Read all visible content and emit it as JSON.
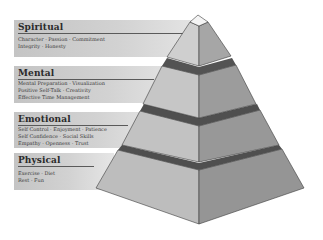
{
  "diagram": {
    "type": "pyramid",
    "tiers": [
      {
        "name": "Spiritual",
        "items": [
          "Character · Passion · Commitment",
          "Integrity · Honesty"
        ]
      },
      {
        "name": "Mental",
        "items": [
          "Mental Preparation · Visualization",
          "Positive Self-Talk · Creativity",
          "Effective Time Management"
        ]
      },
      {
        "name": "Emotional",
        "items": [
          "Self Control · Enjoyment · Patience",
          "Self Confidence · Social Skills",
          "Empathy · Openness · Trust"
        ]
      },
      {
        "name": "Physical",
        "items": [
          "Exercise · Diet",
          "Rest · Fun"
        ]
      }
    ],
    "colors": {
      "band": "#cfcfcf",
      "face_light": "#c8c8c8",
      "face_dark": "#9c9c9c",
      "collar": "#555555",
      "cap": "#f4f4f4",
      "outline": "#3a3a3a"
    }
  }
}
